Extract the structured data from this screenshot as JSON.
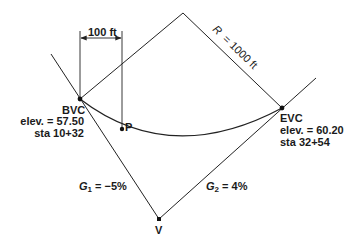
{
  "diagram": {
    "type": "vertical-curve",
    "colors": {
      "line": "#222222",
      "text": "#1a1a1a",
      "background": "#ffffff"
    },
    "dimension": {
      "label": "100 ft"
    },
    "radius": {
      "label": "R = 1000 ft",
      "symbol": "R",
      "value": "= 1000 ft"
    },
    "points": {
      "bvc": {
        "name": "BVC",
        "elev": "elev. = 57.50",
        "sta": "sta 10+32"
      },
      "evc": {
        "name": "EVC",
        "elev": "elev. = 60.20",
        "sta": "sta 32+54"
      },
      "p": {
        "name": "P"
      },
      "v": {
        "name": "V"
      }
    },
    "grades": {
      "g1": {
        "symbol": "G",
        "sub": "1",
        "value": "= −5%"
      },
      "g2": {
        "symbol": "G",
        "sub": "2",
        "value": "= 4%"
      }
    }
  }
}
